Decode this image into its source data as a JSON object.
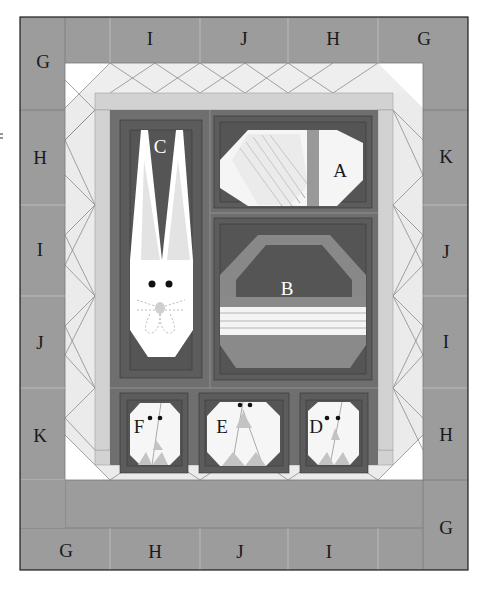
{
  "colors": {
    "border": "#9a9a9a",
    "border_dark": "#6e6e6e",
    "light": "#e6e6e6",
    "lighter": "#f3f3f3",
    "white": "#ffffff",
    "mid": "#c8c8c8",
    "block_dark": "#5a5a5a",
    "block_mid": "#7c7c7c",
    "sashing": "#6a6a6a",
    "outline": "#1c1c1c"
  },
  "border_labels": {
    "top": [
      "G",
      "I",
      "J",
      "H",
      "G"
    ],
    "left": [
      "H",
      "I",
      "J",
      "K"
    ],
    "right": [
      "K",
      "J",
      "I",
      "H",
      "G"
    ],
    "bottom": [
      "G",
      "H",
      "J",
      "I"
    ]
  },
  "blocks": [
    {
      "id": "A",
      "label": "A",
      "motif": "egg"
    },
    {
      "id": "B",
      "label": "B",
      "motif": "basket"
    },
    {
      "id": "C",
      "label": "C",
      "motif": "bunny"
    },
    {
      "id": "D",
      "label": "D",
      "motif": "chick"
    },
    {
      "id": "E",
      "label": "E",
      "motif": "chick"
    },
    {
      "id": "F",
      "label": "F",
      "motif": "chick"
    }
  ]
}
